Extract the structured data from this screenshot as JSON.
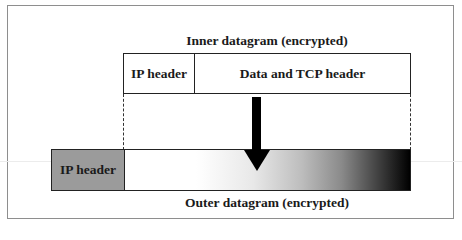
{
  "diagram": {
    "inner_title": "Inner datagram  (encrypted)",
    "inner_cells": [
      {
        "label": "IP header"
      },
      {
        "label": "Data and TCP header"
      }
    ],
    "outer_cells": [
      {
        "label": "IP header"
      }
    ],
    "outer_title": "Outer datagram  (encrypted)",
    "arrow_direction": "down-arrow-icon",
    "colors": {
      "outer_ip_fill": "#9b9b9b",
      "payload_gradient_start": "#ffffff",
      "payload_gradient_end": "#000000",
      "frame_border": "#8e8e8e"
    }
  }
}
